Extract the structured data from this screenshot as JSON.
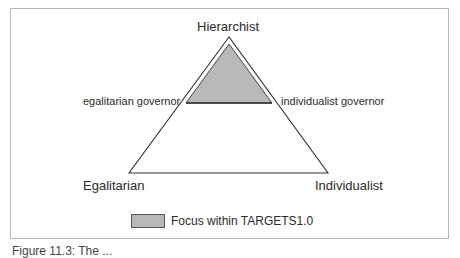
{
  "diagram": {
    "type": "ternary-triangle",
    "vertices": {
      "top": "Hierarchist",
      "bottom_left": "Egalitarian",
      "bottom_right": "Individualist"
    },
    "side_labels": {
      "left": "egalitarian governor",
      "right": "individualist governor"
    },
    "shaded_region": {
      "description": "Top sub-triangle near Hierarchist vertex",
      "fill_color": "#b9b9b9"
    },
    "legend": {
      "swatch_color": "#b9b9b9",
      "label": "Focus within TARGETS1.0"
    },
    "caption": "Figure 11.3: The ..."
  }
}
